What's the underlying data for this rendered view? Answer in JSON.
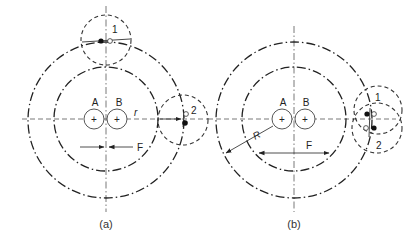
{
  "diagram_a": {
    "caption": "(a)",
    "label_A": "A",
    "label_B": "B",
    "label_r": "r",
    "label_F": "F",
    "label_1": "1",
    "label_2": "2",
    "plus": "+"
  },
  "diagram_b": {
    "caption": "(b)",
    "label_A": "A",
    "label_B": "B",
    "label_R": "R",
    "label_F": "F",
    "label_1": "1",
    "label_2": "2",
    "plus": "+"
  },
  "colors": {
    "line": "#222222",
    "background": "#ffffff"
  }
}
